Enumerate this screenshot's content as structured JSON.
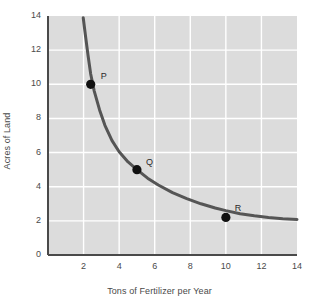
{
  "chart_data": {
    "type": "line",
    "title": "",
    "xlabel": "Tons of Fertilizer per Year",
    "ylabel": "Acres of Land",
    "xlim": [
      0,
      14
    ],
    "ylim": [
      0,
      14
    ],
    "xticks": [
      0,
      2,
      4,
      6,
      8,
      10,
      12,
      14
    ],
    "yticks": [
      0,
      2,
      4,
      6,
      8,
      10,
      12,
      14
    ],
    "xtick_labels": [
      "0",
      "2",
      "4",
      "6",
      "8",
      "10",
      "12",
      "14"
    ],
    "ytick_labels": [
      "0",
      "2",
      "4",
      "6",
      "8",
      "10",
      "12",
      "14"
    ],
    "grid": true,
    "grid_color": "#ffffff",
    "plot_bgcolor": "#dcdcdc",
    "legend": null,
    "series": [
      {
        "name": "isoquant",
        "color": "#555555",
        "line_width": 3,
        "x": [
          1.98,
          2.1,
          2.25,
          2.4,
          2.6,
          2.9,
          3.2,
          3.6,
          4.0,
          4.5,
          5.0,
          5.6,
          6.2,
          7.0,
          7.8,
          8.6,
          9.4,
          10.0,
          10.8,
          11.6,
          12.4,
          13.2,
          14.0
        ],
        "y": [
          13.9,
          12.9,
          11.7,
          10.6,
          9.6,
          8.5,
          7.6,
          6.7,
          6.05,
          5.45,
          5.0,
          4.5,
          4.1,
          3.65,
          3.3,
          3.0,
          2.75,
          2.6,
          2.42,
          2.3,
          2.2,
          2.12,
          2.08
        ]
      }
    ],
    "points": [
      {
        "label": "P",
        "x": 2.4,
        "y": 10.0,
        "marker": "filled-circle",
        "marker_color": "#111111",
        "label_dx": 10,
        "label_dy": -13
      },
      {
        "label": "Q",
        "x": 5.0,
        "y": 5.0,
        "marker": "filled-circle",
        "marker_color": "#111111",
        "label_dx": 9,
        "label_dy": -13
      },
      {
        "label": "R",
        "x": 10.0,
        "y": 2.2,
        "marker": "filled-circle",
        "marker_color": "#111111",
        "label_dx": 9,
        "label_dy": -14
      }
    ],
    "axis_color": "#4a4a4a"
  }
}
